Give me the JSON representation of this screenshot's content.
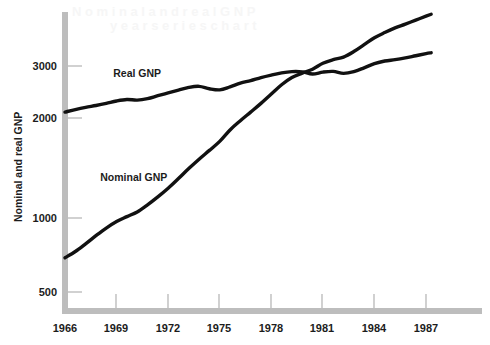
{
  "chart_data": {
    "type": "line",
    "title": "",
    "xlabel": "",
    "ylabel": "Nominal and real GNP",
    "yscale": "log",
    "ylim": [
      430,
      4200
    ],
    "xlim": [
      1966,
      1987.3
    ],
    "grid": false,
    "legend_position": "inline-annotations",
    "x_ticks": [
      1966,
      1969,
      1972,
      1975,
      1978,
      1981,
      1984,
      1987
    ],
    "x_tick_labels": [
      "1966",
      "1969",
      "1972",
      "1975",
      "1978",
      "1981",
      "1984",
      "1987"
    ],
    "y_ticks": [
      500,
      1000,
      2000,
      3000
    ],
    "y_tick_labels": [
      "500",
      "1000",
      "2000",
      "3000"
    ],
    "series": [
      {
        "name": "Real GNP",
        "label_x": 1970.2,
        "label_y": 2780,
        "x": [
          1966.0,
          1966.6,
          1967.2,
          1967.8,
          1968.4,
          1969.0,
          1969.6,
          1970.2,
          1970.8,
          1971.4,
          1972.0,
          1972.6,
          1973.2,
          1973.8,
          1974.4,
          1975.0,
          1975.6,
          1976.2,
          1976.8,
          1977.4,
          1978.0,
          1978.6,
          1979.2,
          1979.8,
          1980.4,
          1981.0,
          1981.6,
          1982.2,
          1982.8,
          1983.4,
          1984.0,
          1984.6,
          1985.2,
          1985.8,
          1986.4,
          1987.0,
          1987.3
        ],
        "values": [
          2150,
          2190,
          2225,
          2255,
          2290,
          2330,
          2355,
          2345,
          2370,
          2420,
          2470,
          2520,
          2570,
          2590,
          2545,
          2525,
          2580,
          2650,
          2700,
          2760,
          2810,
          2855,
          2880,
          2875,
          2830,
          2870,
          2885,
          2845,
          2880,
          2960,
          3050,
          3110,
          3140,
          3180,
          3230,
          3280,
          3300
        ]
      },
      {
        "name": "Nominal GNP",
        "label_x": 1970.0,
        "label_y": 1310,
        "x": [
          1966.0,
          1966.6,
          1967.2,
          1967.8,
          1968.4,
          1969.0,
          1969.6,
          1970.2,
          1970.8,
          1971.4,
          1972.0,
          1972.6,
          1973.2,
          1973.8,
          1974.4,
          1975.0,
          1975.6,
          1976.2,
          1976.8,
          1977.4,
          1978.0,
          1978.6,
          1979.2,
          1979.8,
          1980.4,
          1981.0,
          1981.6,
          1982.2,
          1982.8,
          1983.4,
          1984.0,
          1984.6,
          1985.2,
          1985.8,
          1986.4,
          1987.0,
          1987.3
        ],
        "values": [
          750,
          785,
          830,
          880,
          930,
          975,
          1010,
          1045,
          1100,
          1165,
          1240,
          1330,
          1430,
          1530,
          1630,
          1740,
          1890,
          2020,
          2150,
          2290,
          2450,
          2620,
          2760,
          2850,
          2930,
          3060,
          3140,
          3200,
          3330,
          3500,
          3680,
          3820,
          3950,
          4060,
          4180,
          4300,
          4360
        ]
      }
    ],
    "annotations": [
      {
        "text": "Real GNP",
        "x": 1970.2,
        "y": 2780
      },
      {
        "text": "Nominal GNP",
        "x": 1970.0,
        "y": 1310
      }
    ],
    "colors": {
      "line": "#111111",
      "axis": "#bdbdbd",
      "text": "#1c1c1c",
      "background": "#ffffff"
    }
  }
}
